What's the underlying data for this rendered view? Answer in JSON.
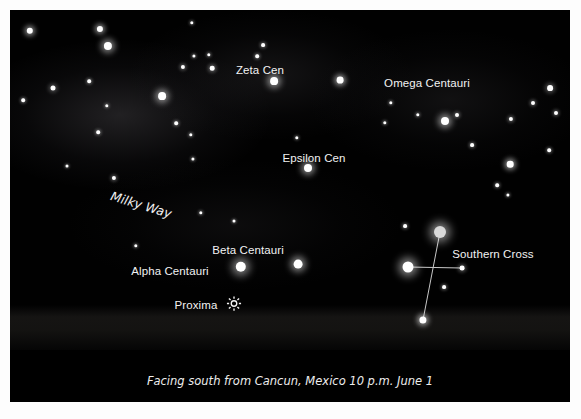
{
  "figure": {
    "type": "star-chart",
    "caption": "Facing south from Cancun, Mexico 10 p.m. June 1",
    "background_color": "#010101",
    "border_color": "#ffffff",
    "star_color": "#ffffff",
    "label_color": "#f2f2f2",
    "line_color": "#c8c8c8"
  },
  "labels": [
    {
      "id": "zeta-cen",
      "text": "Zeta Cen",
      "x": 250,
      "y": 60,
      "size": 11.5
    },
    {
      "id": "omega-centauri",
      "text": "Omega Centauri",
      "x": 417,
      "y": 73,
      "size": 11.5
    },
    {
      "id": "epsilon-cen",
      "text": "Epsilon Cen",
      "x": 304,
      "y": 148,
      "size": 11.5
    },
    {
      "id": "beta-centauri",
      "text": "Beta Centauri",
      "x": 238,
      "y": 240,
      "size": 11.5
    },
    {
      "id": "alpha-centauri",
      "text": "Alpha Centauri",
      "x": 160,
      "y": 261,
      "size": 11.5
    },
    {
      "id": "proxima",
      "text": "Proxima",
      "x": 186,
      "y": 295,
      "size": 11.5
    },
    {
      "id": "southern-cross",
      "text": "Southern Cross",
      "x": 483,
      "y": 244,
      "size": 11.5
    }
  ],
  "milky_way_label": {
    "text": "Milky Way",
    "x": 101,
    "y": 178,
    "rotation_deg": 17,
    "size": 12.5
  },
  "proxima_marker": {
    "glyph": "☀",
    "x": 224,
    "y": 295,
    "size": 13
  },
  "stars": [
    {
      "x": 20,
      "y": 21,
      "r": 3.2
    },
    {
      "x": 90,
      "y": 19,
      "r": 3.1
    },
    {
      "x": 98,
      "y": 36,
      "r": 4.1
    },
    {
      "x": 182,
      "y": 13,
      "r": 1.7
    },
    {
      "x": 173,
      "y": 57,
      "r": 2.1
    },
    {
      "x": 184,
      "y": 46,
      "r": 1.6
    },
    {
      "x": 199,
      "y": 45,
      "r": 1.7
    },
    {
      "x": 202,
      "y": 58,
      "r": 2.3
    },
    {
      "x": 253,
      "y": 35,
      "r": 1.9
    },
    {
      "x": 247,
      "y": 46,
      "r": 1.8
    },
    {
      "x": 264,
      "y": 71,
      "r": 3.9
    },
    {
      "x": 13,
      "y": 90,
      "r": 1.8
    },
    {
      "x": 43,
      "y": 78,
      "r": 2.5
    },
    {
      "x": 79,
      "y": 71,
      "r": 1.8
    },
    {
      "x": 152,
      "y": 86,
      "r": 3.9
    },
    {
      "x": 97,
      "y": 96,
      "r": 1.7
    },
    {
      "x": 88,
      "y": 122,
      "r": 1.8
    },
    {
      "x": 166,
      "y": 113,
      "r": 1.8
    },
    {
      "x": 181,
      "y": 125,
      "r": 1.7
    },
    {
      "x": 183,
      "y": 149,
      "r": 1.6
    },
    {
      "x": 287,
      "y": 128,
      "r": 1.7
    },
    {
      "x": 298,
      "y": 158,
      "r": 4.0
    },
    {
      "x": 330,
      "y": 70,
      "r": 3.4
    },
    {
      "x": 381,
      "y": 93,
      "r": 1.7
    },
    {
      "x": 375,
      "y": 113,
      "r": 1.7
    },
    {
      "x": 408,
      "y": 105,
      "r": 1.7
    },
    {
      "x": 435,
      "y": 111,
      "r": 4.0
    },
    {
      "x": 447,
      "y": 105,
      "r": 2.0
    },
    {
      "x": 462,
      "y": 135,
      "r": 1.9
    },
    {
      "x": 500,
      "y": 154,
      "r": 3.3
    },
    {
      "x": 487,
      "y": 175,
      "r": 1.8
    },
    {
      "x": 501,
      "y": 109,
      "r": 2.1
    },
    {
      "x": 523,
      "y": 93,
      "r": 2.0
    },
    {
      "x": 540,
      "y": 78,
      "r": 2.9
    },
    {
      "x": 546,
      "y": 103,
      "r": 2.0
    },
    {
      "x": 539,
      "y": 140,
      "r": 1.8
    },
    {
      "x": 498,
      "y": 185,
      "r": 1.6
    },
    {
      "x": 104,
      "y": 168,
      "r": 2.1
    },
    {
      "x": 191,
      "y": 203,
      "r": 1.7
    },
    {
      "x": 126,
      "y": 236,
      "r": 1.7
    },
    {
      "x": 231,
      "y": 257,
      "r": 5.2
    },
    {
      "x": 288,
      "y": 254,
      "r": 4.4
    },
    {
      "x": 395,
      "y": 216,
      "r": 1.9
    },
    {
      "x": 430,
      "y": 222,
      "r": 6.0,
      "color": "#d9d9d9"
    },
    {
      "x": 398,
      "y": 257,
      "r": 5.5
    },
    {
      "x": 452,
      "y": 258,
      "r": 2.4
    },
    {
      "x": 434,
      "y": 277,
      "r": 1.9
    },
    {
      "x": 413,
      "y": 310,
      "r": 3.6
    },
    {
      "x": 57,
      "y": 156,
      "r": 1.5
    },
    {
      "x": 224,
      "y": 211,
      "r": 1.5
    }
  ],
  "constellation_lines": [
    {
      "name": "southern-cross-vertical",
      "x1": 430,
      "y1": 222,
      "x2": 413,
      "y2": 310
    },
    {
      "name": "southern-cross-horizontal",
      "x1": 398,
      "y1": 257,
      "x2": 452,
      "y2": 258
    }
  ]
}
